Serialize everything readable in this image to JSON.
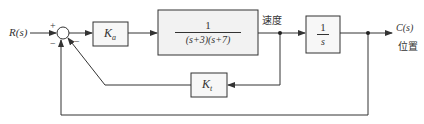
{
  "diagram": {
    "type": "control-system-block-diagram",
    "input": {
      "label": "R(s)"
    },
    "output": {
      "label": "C(s)",
      "caption": "位置"
    },
    "summing_junction": {
      "signs": {
        "reference": "+",
        "inner_feedback": "−",
        "outer_feedback": "−"
      }
    },
    "blocks": {
      "amplifier": {
        "label": "K",
        "subscript": "a"
      },
      "plant": {
        "numerator": "1",
        "denominator": "(s+3)(s+7)"
      },
      "integrator": {
        "numerator": "1",
        "denominator": "s"
      },
      "tachometer": {
        "label": "K",
        "subscript": "t"
      }
    },
    "signals": {
      "velocity": "速度",
      "position": "位置"
    },
    "colors": {
      "line": "#333333",
      "block_fill_plant": "#f2f2f2",
      "block_fill_other": "#f7f7f7"
    }
  }
}
